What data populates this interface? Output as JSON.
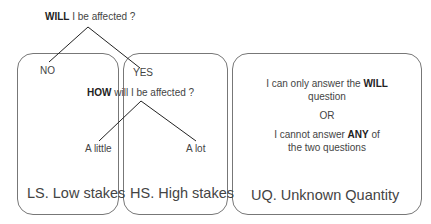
{
  "tree": {
    "root_question": {
      "bold": "WILL",
      "rest": " I be affected ?"
    },
    "branch_no": "NO",
    "branch_yes": "YES",
    "sub_question": {
      "bold": "HOW",
      "rest": " will I be affected ?"
    },
    "leaf_little": "A little",
    "leaf_lot": "A lot"
  },
  "boxes": [
    {
      "id": "LS",
      "label": "LS. Low stakes"
    },
    {
      "id": "HS",
      "label": "HS. High stakes"
    },
    {
      "id": "UQ",
      "label": "UQ. Unknown Quantity"
    }
  ],
  "uq_description": {
    "line1_pre": "I can only answer the ",
    "line1_bold": "WILL",
    "line2": "question",
    "or": "OR",
    "line3_pre": "I cannot answer ",
    "line3_bold": "ANY",
    "line3_post": " of",
    "line4": "the two questions"
  },
  "colors": {
    "line": "#222222",
    "border": "#777777",
    "text": "#444444"
  }
}
